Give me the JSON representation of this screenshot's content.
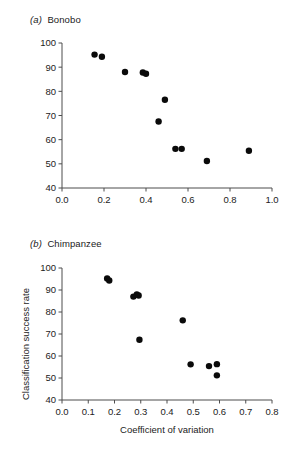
{
  "figure": {
    "panels": [
      {
        "tag": "(a)",
        "title": "Bonobo",
        "xlabel": "",
        "ylabel": "",
        "xlim": [
          0.0,
          1.0
        ],
        "ylim": [
          40,
          100
        ],
        "xticks": [
          "0.0",
          "0.2",
          "0.4",
          "0.6",
          "0.8",
          "1.0"
        ],
        "yticks": [
          "40",
          "50",
          "60",
          "70",
          "80",
          "90",
          "100"
        ]
      },
      {
        "tag": "(b)",
        "title": "Chimpanzee",
        "xlabel": "Coefficient of variation",
        "ylabel": "Classification success rate",
        "xlim": [
          0.0,
          0.8
        ],
        "ylim": [
          40,
          100
        ],
        "xticks": [
          "0.0",
          "0.1",
          "0.2",
          "0.3",
          "0.4",
          "0.5",
          "0.6",
          "0.7",
          "0.8"
        ],
        "yticks": [
          "40",
          "50",
          "60",
          "70",
          "80",
          "90",
          "100"
        ]
      }
    ],
    "marker_color": "#0a0a0a",
    "axis_color": "#4d4d4d"
  },
  "chart_data": [
    {
      "type": "scatter",
      "title": "(a) Bonobo",
      "xlabel": "Coefficient of variation",
      "ylabel": "Classification success rate",
      "xlim": [
        0.0,
        1.0
      ],
      "ylim": [
        40,
        100
      ],
      "xticks": [
        0.0,
        0.2,
        0.4,
        0.6,
        0.8,
        1.0
      ],
      "yticks": [
        40,
        50,
        60,
        70,
        80,
        90,
        100
      ],
      "grid": false,
      "legend": "none",
      "series": [
        {
          "name": "Bonobo",
          "x": [
            0.155,
            0.19,
            0.3,
            0.385,
            0.4,
            0.46,
            0.49,
            0.54,
            0.57,
            0.69,
            0.89
          ],
          "y": [
            95.2,
            94.3,
            88.0,
            87.8,
            87.3,
            67.5,
            76.5,
            56.2,
            56.2,
            51.2,
            55.4
          ]
        }
      ]
    },
    {
      "type": "scatter",
      "title": "(b) Chimpanzee",
      "xlabel": "Coefficient of variation",
      "ylabel": "Classification success rate",
      "xlim": [
        0.0,
        0.8
      ],
      "ylim": [
        40,
        100
      ],
      "xticks": [
        0.0,
        0.1,
        0.2,
        0.3,
        0.4,
        0.5,
        0.6,
        0.7,
        0.8
      ],
      "yticks": [
        40,
        50,
        60,
        70,
        80,
        90,
        100
      ],
      "grid": false,
      "legend": "none",
      "series": [
        {
          "name": "Chimpanzee",
          "x": [
            0.172,
            0.18,
            0.272,
            0.285,
            0.292,
            0.295,
            0.46,
            0.49,
            0.56,
            0.59,
            0.59
          ],
          "y": [
            95.2,
            94.3,
            87.0,
            88.0,
            87.5,
            67.4,
            76.2,
            56.2,
            55.4,
            56.3,
            51.2
          ]
        }
      ]
    }
  ]
}
